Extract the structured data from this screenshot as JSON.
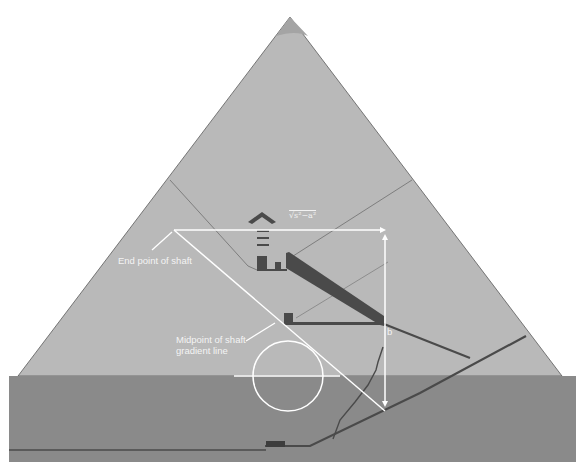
{
  "diagram": {
    "colors": {
      "background": "#ffffff",
      "pyramid_fill": "#b9b9b9",
      "apex_cap": "#a9a9a9",
      "ground_fill": "#8a8a8a",
      "passage_fill": "#4a4a4a",
      "construction_line": "#ffffff",
      "thin_line": "#6e6e6e"
    },
    "labels": {
      "end_point": "End point of shaft",
      "midpoint_line1": "Midpoint of shaft",
      "midpoint_line2": "gradient line",
      "b": "b",
      "formula": "√s²−a²"
    }
  }
}
